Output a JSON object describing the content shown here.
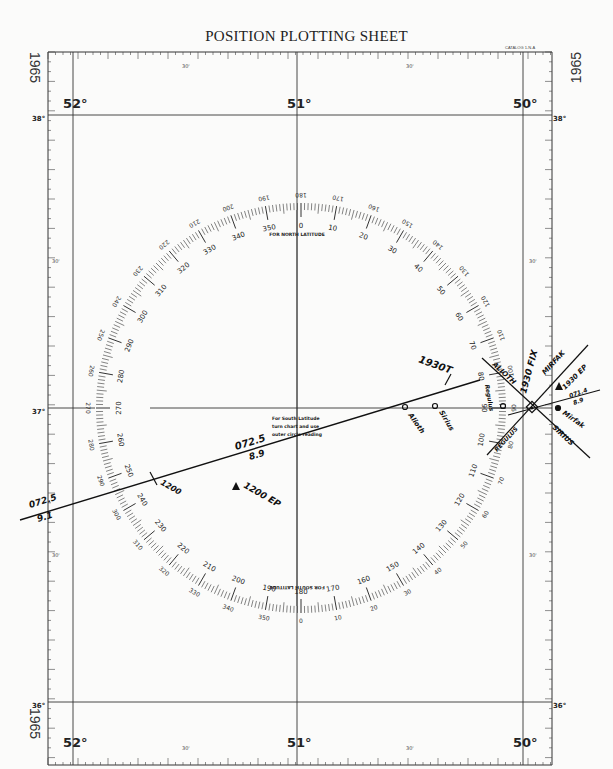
{
  "header": {
    "top_fragment": "Pl.37",
    "title": "POSITION PLOTTING SHEET",
    "catalog": "CATALOG 1-N-A"
  },
  "margin_year": "1965",
  "longitude_labels": [
    "52°",
    "51°",
    "50°"
  ],
  "latitude_labels": [
    "38°",
    "37°",
    "36°"
  ],
  "minute_labels": {
    "half": "30'"
  },
  "compass_rose": {
    "north_caption": "FOR NORTH LATITUDE",
    "south_caption": "FOR SOUTH LATITUDE",
    "center_note": [
      "For South Latitude",
      "turn chart and use",
      "outer circle reading"
    ],
    "inner_labels": [
      "0",
      "10",
      "20",
      "30",
      "40",
      "50",
      "60",
      "70",
      "80",
      "90",
      "100",
      "110",
      "120",
      "130",
      "140",
      "150",
      "160",
      "170",
      "180",
      "190",
      "200",
      "210",
      "220",
      "230",
      "240",
      "250",
      "260",
      "270",
      "280",
      "290",
      "300",
      "310",
      "320",
      "330",
      "340",
      "350"
    ]
  },
  "plot": {
    "lop_1200_course": "072.5",
    "lop_1200_dist": "9.1",
    "lop_1200_time": "1200",
    "ep_1200": "1200 EP",
    "course_mid": "072.5",
    "dist_mid": "8.9",
    "time_1930": "1930T",
    "alioth_point": "Alioth",
    "sirius_point": "Sirius",
    "regulus_point": "Regulus",
    "mirfak_point": "Mirfak",
    "fix_label": "1930 FIX",
    "ep_1930": "1930 EP",
    "course_short": "071.4",
    "dist_short": "8.9",
    "lop_alioth": "ALIOTH",
    "lop_mirfak": "MIRFAK",
    "lop_regulus": "REGULUS",
    "lop_sirius": "SIRIUS"
  }
}
